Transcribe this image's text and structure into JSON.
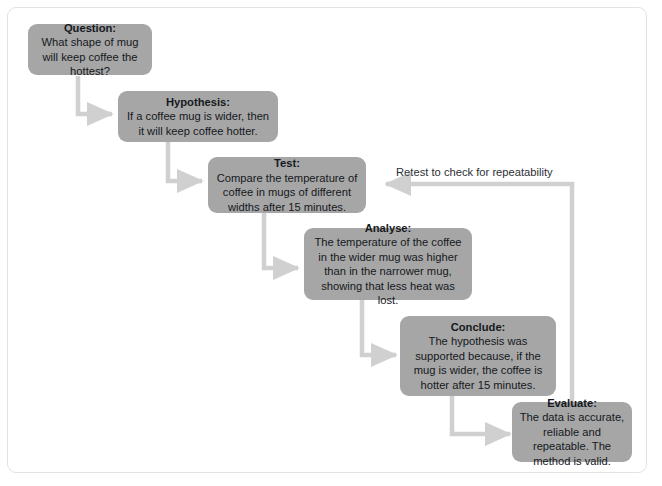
{
  "diagram": {
    "box_fill": "#a6a6a6",
    "text_color": "#15191d",
    "connector_color": "#d0d0d0",
    "card_border": "#e2e2e2",
    "background": "#ffffff",
    "nodes": [
      {
        "id": "question",
        "title": "Question:",
        "body": "What shape of mug will keep coffee the hottest?"
      },
      {
        "id": "hypothesis",
        "title": "Hypothesis:",
        "body": "If a coffee mug is wider, then it will keep coffee hotter."
      },
      {
        "id": "test",
        "title": "Test:",
        "body": "Compare the temperature of coffee in mugs of different widths after 15 minutes."
      },
      {
        "id": "analyse",
        "title": "Analyse:",
        "body": "The temperature of the coffee in the wider mug was higher than in the narrower mug, showing that less heat was lost."
      },
      {
        "id": "conclude",
        "title": "Conclude:",
        "body": "The hypothesis was supported because, if the mug is wider, the coffee is hotter after 15 minutes."
      },
      {
        "id": "evaluate",
        "title": "Evaluate:",
        "body": "The data is accurate, reliable and repeatable. The method is valid."
      }
    ],
    "loop_label": "Retest to check for repeatability"
  }
}
